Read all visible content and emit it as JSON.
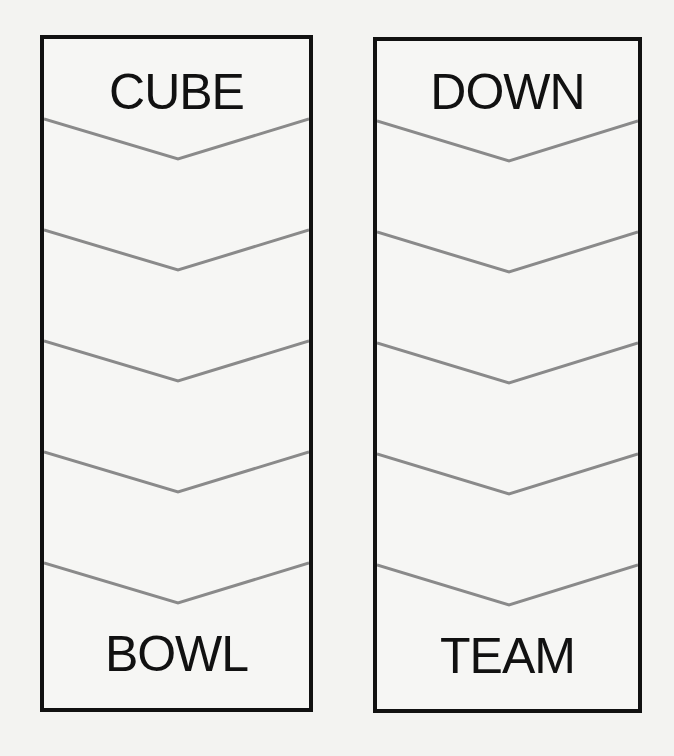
{
  "puzzle": {
    "type": "word-ladder",
    "ladders": [
      {
        "start_word": "CUBE",
        "end_word": "BOWL",
        "blank_steps": 4
      },
      {
        "start_word": "DOWN",
        "end_word": "TEAM",
        "blank_steps": 4
      }
    ],
    "colors": {
      "border": "#111111",
      "chevron": "#8a8a8a",
      "text": "#111111",
      "background": "#f3f3f1"
    }
  }
}
